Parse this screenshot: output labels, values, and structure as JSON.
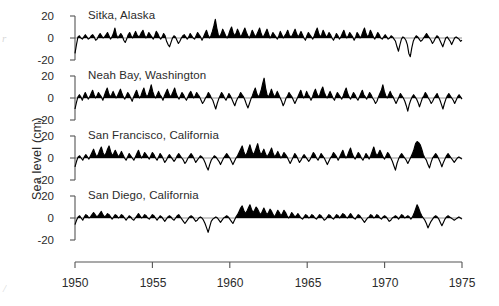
{
  "figure": {
    "y_axis_label": "Sea level (cm)",
    "x_tick_labels": [
      "1950",
      "1955",
      "1960",
      "1965",
      "1970",
      "1975"
    ],
    "y_tick_labels": [
      "20",
      "0",
      "-20"
    ],
    "line_color": "#000000",
    "fill_color": "#000000",
    "axis_color": "#555555"
  },
  "chart_data": {
    "type": "line",
    "title": "",
    "xlabel": "",
    "ylabel": "Sea level (cm)",
    "xlim": [
      1950,
      1975
    ],
    "ylim": [
      -30,
      25
    ],
    "yticks": [
      20,
      0,
      -20
    ],
    "xticks": [
      1950,
      1955,
      1960,
      1965,
      1970,
      1975
    ],
    "grid": false,
    "legend": "none",
    "panel_layout": "4 stacked panels sharing one x-axis; positive anomalies filled black above zero line",
    "x_step_years": 0.25,
    "panels": [
      {
        "name": "Sitka, Alaska",
        "label": "Sitka, Alaska",
        "values": [
          -14,
          -6,
          1,
          2,
          0,
          -1,
          1,
          3,
          1,
          -1,
          0,
          2,
          3,
          1,
          -2,
          -1,
          2,
          4,
          2,
          0,
          1,
          3,
          5,
          2,
          -1,
          1,
          4,
          9,
          3,
          0,
          2,
          4,
          2,
          -2,
          -4,
          -1,
          3,
          5,
          2,
          0,
          3,
          6,
          3,
          1,
          2,
          5,
          7,
          3,
          0,
          2,
          5,
          3,
          1,
          -1,
          2,
          6,
          4,
          1,
          -1,
          1,
          4,
          2,
          -3,
          -6,
          -8,
          -4,
          0,
          2,
          1,
          -2,
          -5,
          -3,
          0,
          2,
          3,
          1,
          -1,
          1,
          4,
          2,
          0,
          -1,
          2,
          5,
          3,
          1,
          -2,
          1,
          4,
          7,
          3,
          0,
          2,
          6,
          11,
          17,
          9,
          3,
          1,
          4,
          8,
          5,
          2,
          0,
          3,
          7,
          10,
          5,
          2,
          4,
          8,
          5,
          1,
          3,
          6,
          9,
          5,
          2,
          0,
          3,
          7,
          4,
          1,
          3,
          6,
          9,
          4,
          1,
          2,
          5,
          8,
          4,
          0,
          2,
          5,
          3,
          1,
          -1,
          2,
          6,
          3,
          0,
          2,
          4,
          7,
          3,
          1,
          2,
          5,
          8,
          4,
          1,
          3,
          6,
          3,
          0,
          -2,
          2,
          5,
          3,
          1,
          -1,
          2,
          6,
          9,
          4,
          1,
          3,
          7,
          4,
          1,
          2,
          5,
          3,
          0,
          -2,
          1,
          4,
          2,
          -1,
          1,
          4,
          7,
          3,
          0,
          2,
          5,
          3,
          1,
          -2,
          1,
          5,
          3,
          0,
          2,
          6,
          9,
          4,
          1,
          3,
          7,
          4,
          1,
          -1,
          2,
          5,
          3,
          0,
          -1,
          1,
          3,
          1,
          -1,
          0,
          2,
          1,
          -1,
          -3,
          -8,
          -12,
          -6,
          -1,
          1,
          0,
          -2,
          -6,
          -14,
          -17,
          -9,
          -3,
          0,
          2,
          1,
          -1,
          -3,
          -2,
          0,
          2,
          4,
          2,
          0,
          -2,
          -5,
          -3,
          0,
          2,
          1,
          -2,
          -5,
          -8,
          -4,
          0,
          1,
          -1,
          -3,
          -6,
          -3,
          0,
          1,
          0,
          -1,
          -3,
          -2
        ]
      },
      {
        "name": "Neah Bay, Washington",
        "label": "Neah Bay, Washington",
        "values": [
          -10,
          -4,
          1,
          3,
          1,
          -2,
          2,
          5,
          2,
          -1,
          1,
          4,
          7,
          3,
          0,
          2,
          5,
          3,
          1,
          -2,
          2,
          6,
          9,
          4,
          1,
          3,
          6,
          3,
          0,
          2,
          5,
          8,
          4,
          1,
          -1,
          2,
          5,
          3,
          0,
          -3,
          1,
          4,
          7,
          3,
          0,
          2,
          6,
          9,
          4,
          1,
          3,
          7,
          12,
          6,
          2,
          0,
          3,
          6,
          3,
          1,
          -2,
          2,
          5,
          8,
          4,
          1,
          3,
          6,
          9,
          4,
          1,
          -1,
          2,
          5,
          3,
          0,
          -2,
          1,
          4,
          6,
          3,
          0,
          2,
          5,
          3,
          1,
          -2,
          -5,
          -3,
          0,
          2,
          5,
          3,
          0,
          -2,
          -6,
          -10,
          -5,
          -1,
          2,
          5,
          3,
          0,
          -2,
          1,
          4,
          2,
          -1,
          -4,
          -7,
          -3,
          0,
          2,
          5,
          3,
          1,
          -2,
          -6,
          -9,
          -5,
          -1,
          2,
          6,
          9,
          4,
          1,
          3,
          7,
          13,
          18,
          9,
          3,
          1,
          4,
          8,
          4,
          1,
          3,
          6,
          3,
          0,
          -3,
          -7,
          -4,
          0,
          2,
          5,
          3,
          1,
          -2,
          -5,
          -2,
          1,
          4,
          7,
          3,
          0,
          2,
          6,
          3,
          1,
          -2,
          1,
          5,
          8,
          4,
          1,
          3,
          7,
          10,
          5,
          2,
          0,
          3,
          6,
          3,
          0,
          -2,
          2,
          5,
          3,
          1,
          -1,
          2,
          6,
          9,
          4,
          1,
          -1,
          2,
          5,
          3,
          0,
          -2,
          1,
          4,
          7,
          3,
          1,
          -1,
          2,
          5,
          3,
          0,
          -2,
          -5,
          -3,
          1,
          4,
          7,
          12,
          6,
          2,
          0,
          3,
          6,
          3,
          1,
          -2,
          -5,
          -2,
          1,
          4,
          2,
          0,
          -3,
          -7,
          -12,
          -6,
          -2,
          1,
          3,
          1,
          -1,
          -4,
          -8,
          -4,
          0,
          2,
          5,
          3,
          0,
          -2,
          -5,
          -3,
          0,
          2,
          4,
          1,
          -2,
          -6,
          -10,
          -5,
          -1,
          2,
          4,
          2,
          0,
          -2,
          -5,
          -2,
          1,
          3,
          1,
          -1
        ]
      },
      {
        "name": "San Francisco, California",
        "label": "San Francisco, California",
        "values": [
          -8,
          -3,
          1,
          2,
          0,
          -2,
          1,
          3,
          1,
          -1,
          2,
          5,
          8,
          4,
          1,
          3,
          7,
          10,
          5,
          2,
          4,
          8,
          11,
          6,
          2,
          4,
          7,
          4,
          1,
          3,
          6,
          3,
          0,
          -2,
          1,
          4,
          2,
          0,
          -2,
          1,
          4,
          7,
          3,
          0,
          2,
          5,
          3,
          1,
          -1,
          2,
          5,
          3,
          0,
          -2,
          1,
          4,
          2,
          -1,
          -4,
          -2,
          1,
          3,
          1,
          -1,
          -3,
          -1,
          2,
          4,
          2,
          0,
          -2,
          -5,
          -3,
          0,
          2,
          4,
          2,
          -1,
          -4,
          -2,
          0,
          2,
          1,
          -1,
          -4,
          -8,
          -11,
          -6,
          -2,
          0,
          2,
          1,
          -1,
          -3,
          -6,
          -3,
          0,
          2,
          4,
          2,
          0,
          -3,
          -6,
          -3,
          0,
          2,
          5,
          8,
          11,
          6,
          2,
          4,
          8,
          12,
          7,
          3,
          5,
          9,
          13,
          7,
          3,
          5,
          8,
          4,
          1,
          3,
          6,
          9,
          4,
          1,
          3,
          6,
          3,
          0,
          2,
          5,
          3,
          1,
          -2,
          -5,
          -2,
          1,
          4,
          2,
          -1,
          -4,
          -2,
          1,
          3,
          1,
          -1,
          -3,
          -1,
          2,
          5,
          3,
          0,
          -2,
          1,
          4,
          2,
          0,
          -3,
          -6,
          -3,
          0,
          2,
          5,
          3,
          1,
          -2,
          1,
          4,
          7,
          3,
          0,
          2,
          6,
          9,
          4,
          1,
          -1,
          2,
          5,
          3,
          0,
          -2,
          1,
          4,
          2,
          -1,
          2,
          6,
          10,
          5,
          2,
          4,
          7,
          4,
          1,
          -1,
          2,
          5,
          3,
          0,
          -3,
          -7,
          -11,
          -5,
          -1,
          2,
          4,
          2,
          0,
          -2,
          -5,
          -2,
          1,
          4,
          8,
          13,
          15,
          14,
          12,
          8,
          3,
          0,
          -2,
          -6,
          -9,
          -4,
          0,
          2,
          4,
          2,
          -1,
          -4,
          -8,
          -4,
          -1,
          2,
          4,
          2,
          0,
          -2,
          -4,
          -2,
          0,
          1,
          0,
          -1
        ]
      },
      {
        "name": "San Diego, California",
        "label": "San Diego, California",
        "values": [
          -6,
          -2,
          1,
          2,
          0,
          -2,
          1,
          3,
          2,
          0,
          1,
          3,
          5,
          3,
          1,
          2,
          4,
          6,
          3,
          1,
          2,
          4,
          3,
          1,
          -1,
          1,
          3,
          2,
          0,
          1,
          3,
          2,
          0,
          -2,
          0,
          2,
          1,
          -1,
          -2,
          0,
          2,
          4,
          2,
          0,
          1,
          3,
          2,
          0,
          -1,
          1,
          3,
          2,
          0,
          -2,
          0,
          2,
          1,
          -1,
          -3,
          -1,
          1,
          2,
          1,
          -1,
          -2,
          0,
          2,
          3,
          1,
          -1,
          -3,
          -5,
          -3,
          -1,
          1,
          2,
          1,
          -1,
          -3,
          -2,
          0,
          1,
          0,
          -2,
          -5,
          -9,
          -13,
          -8,
          -3,
          -1,
          0,
          1,
          0,
          -2,
          -4,
          -2,
          0,
          1,
          2,
          1,
          -1,
          -3,
          -5,
          -2,
          1,
          3,
          6,
          9,
          11,
          7,
          4,
          6,
          9,
          12,
          8,
          5,
          7,
          10,
          8,
          5,
          3,
          6,
          9,
          6,
          3,
          5,
          8,
          6,
          3,
          1,
          4,
          7,
          5,
          2,
          4,
          7,
          5,
          2,
          0,
          2,
          5,
          3,
          1,
          2,
          4,
          2,
          0,
          -1,
          1,
          3,
          2,
          0,
          1,
          3,
          2,
          0,
          -1,
          1,
          3,
          2,
          0,
          -2,
          -1,
          1,
          3,
          2,
          0,
          -1,
          1,
          3,
          2,
          0,
          2,
          4,
          3,
          1,
          0,
          2,
          4,
          2,
          0,
          -1,
          1,
          3,
          2,
          0,
          -2,
          -4,
          -2,
          0,
          1,
          3,
          2,
          0,
          1,
          3,
          2,
          0,
          -1,
          1,
          2,
          1,
          -1,
          -3,
          -2,
          0,
          1,
          2,
          1,
          -1,
          1,
          3,
          2,
          0,
          1,
          2,
          1,
          -1,
          1,
          4,
          8,
          12,
          9,
          5,
          2,
          0,
          -2,
          -5,
          -9,
          -6,
          -3,
          -1,
          1,
          2,
          1,
          -1,
          -4,
          -7,
          -4,
          -1,
          1,
          2,
          1,
          0,
          -1,
          -2,
          -1,
          0,
          1,
          0,
          -1
        ]
      }
    ]
  },
  "artifacts": {
    "left_edge_mark": "r",
    "bottom_left_mark": "/"
  }
}
